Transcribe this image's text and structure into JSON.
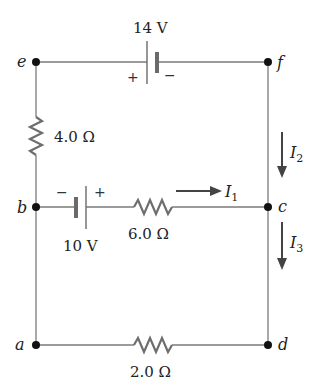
{
  "diagram": {
    "type": "circuit",
    "nodes": [
      {
        "id": "e",
        "label": "e",
        "x": 36,
        "y": 62
      },
      {
        "id": "f",
        "label": "f",
        "x": 268,
        "y": 62
      },
      {
        "id": "b",
        "label": "b",
        "x": 36,
        "y": 207
      },
      {
        "id": "c",
        "label": "c",
        "x": 268,
        "y": 207
      },
      {
        "id": "a",
        "label": "a",
        "x": 36,
        "y": 345
      },
      {
        "id": "d",
        "label": "d",
        "x": 268,
        "y": 345
      }
    ],
    "batteries": [
      {
        "id": "battery-top",
        "between": [
          "e",
          "f"
        ],
        "label": "14 V",
        "plus": "+",
        "minus": "−",
        "plus_side": "left"
      },
      {
        "id": "battery-middle",
        "between": [
          "b",
          "c"
        ],
        "label": "10 V",
        "plus": "+",
        "minus": "−",
        "plus_side": "right"
      }
    ],
    "resistors": [
      {
        "id": "resistor-left",
        "between": [
          "e",
          "b"
        ],
        "label": "4.0 Ω"
      },
      {
        "id": "resistor-middle",
        "between": [
          "b",
          "c"
        ],
        "label": "6.0 Ω"
      },
      {
        "id": "resistor-bottom",
        "between": [
          "a",
          "d"
        ],
        "label": "2.0 Ω"
      }
    ],
    "currents": [
      {
        "id": "I1",
        "symbol": "I",
        "sub": "1",
        "direction": "right",
        "branch": "b-c"
      },
      {
        "id": "I2",
        "symbol": "I",
        "sub": "2",
        "direction": "down",
        "branch": "f-c"
      },
      {
        "id": "I3",
        "symbol": "I",
        "sub": "3",
        "direction": "down",
        "branch": "c-d"
      }
    ]
  }
}
